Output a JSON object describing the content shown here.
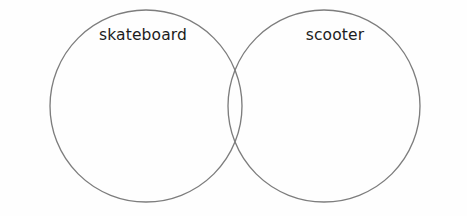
{
  "diagram": {
    "type": "venn",
    "title": "",
    "background_color": "#fefefe",
    "stroke_color": "#7d7d7d",
    "text_color": "#1c1c1c",
    "sets": [
      {
        "id": "left",
        "label": "skateboard",
        "center_x": 146,
        "center_y": 106,
        "radius": 96,
        "label_x": 143,
        "label_y": 28
      },
      {
        "id": "right",
        "label": "scooter",
        "center_x": 324,
        "center_y": 106,
        "radius": 96,
        "label_x": 335,
        "label_y": 28
      }
    ],
    "intersection": {
      "label": "",
      "top_point_x": 235,
      "top_point_y": 41,
      "bottom_point_x": 235,
      "bottom_point_y": 172
    }
  }
}
